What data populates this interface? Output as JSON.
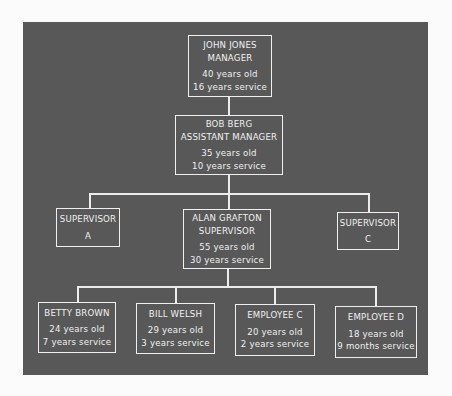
{
  "chart": {
    "type": "org-chart",
    "nodes": {
      "manager": {
        "name": "JOHN JONES",
        "title": "MANAGER",
        "age": "40 years old",
        "service": "16 years service"
      },
      "assistant_manager": {
        "name": "BOB BERG",
        "title": "ASSISTANT MANAGER",
        "age": "35 years old",
        "service": "10 years service"
      },
      "supervisor_a": {
        "title": "SUPERVISOR",
        "label": "A"
      },
      "supervisor_b": {
        "name": "ALAN GRAFTON",
        "title": "SUPERVISOR",
        "age": "55 years old",
        "service": "30 years service"
      },
      "supervisor_c": {
        "title": "SUPERVISOR",
        "label": "C"
      },
      "employees": [
        {
          "name": "BETTY BROWN",
          "age": "24 years old",
          "service": "7 years service"
        },
        {
          "name": "BILL WELSH",
          "age": "29 years old",
          "service": "3 years service"
        },
        {
          "name": "EMPLOYEE C",
          "age": "20 years old",
          "service": "2 years service"
        },
        {
          "name": "EMPLOYEE D",
          "age": "18 years old",
          "service": "9 months service"
        }
      ]
    },
    "colors": {
      "panel": "#585858",
      "lines": "#ececec",
      "text": "#f0f0f0",
      "page": "#fbfbfb"
    }
  }
}
